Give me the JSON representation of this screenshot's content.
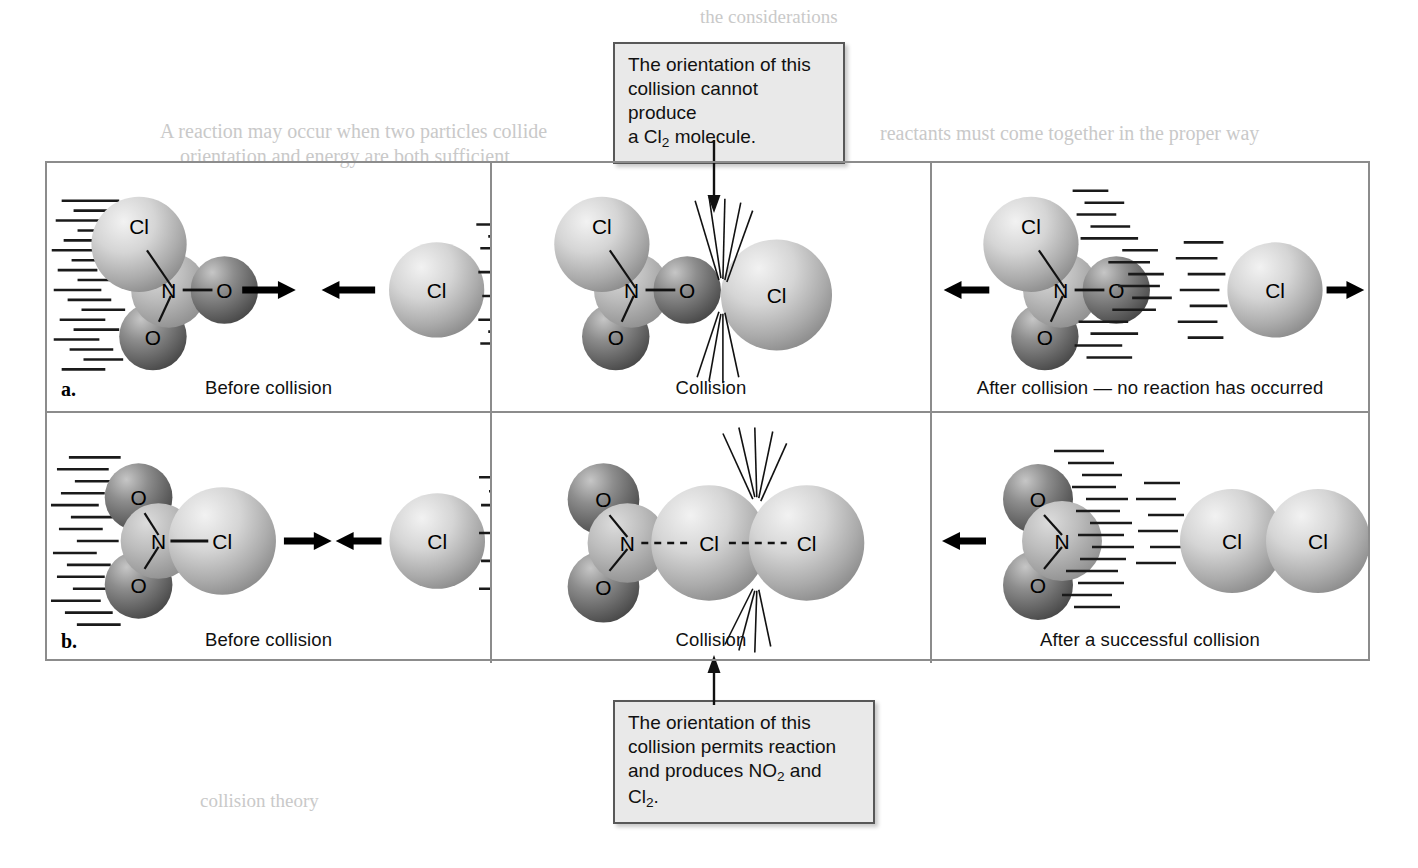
{
  "figure": {
    "title_hidden": "Collision orientation and reaction of NO2Cl with Cl",
    "frame_border_color": "#8c8c8c"
  },
  "callouts": {
    "top": {
      "name": "callout-no-reaction",
      "lines": [
        "The orientation of this",
        "collision cannot produce",
        "a Cl",
        "2",
        " molecule."
      ],
      "line1": "The orientation of this",
      "line2": "collision cannot produce",
      "line3_pre": "a Cl",
      "line3_sub": "2",
      "line3_post": " molecule.",
      "target_panel": "row-a-collision"
    },
    "bottom": {
      "name": "callout-successful-reaction",
      "line1": "The orientation of this",
      "line2": "collision permits reaction",
      "line3_pre": "and produces NO",
      "line3_sub": "2",
      "line3_post": " and",
      "line4_pre": "Cl",
      "line4_sub": "2",
      "line4_post": ".",
      "target_panel": "row-b-collision"
    }
  },
  "rows": [
    {
      "letter": "a.",
      "description": "Unsuccessful collision orientation",
      "panels": [
        {
          "id": "row-a-before",
          "caption": "Before collision"
        },
        {
          "id": "row-a-collision",
          "caption": "Collision"
        },
        {
          "id": "row-a-after",
          "caption": "After collision — no reaction has occurred"
        }
      ]
    },
    {
      "letter": "b.",
      "description": "Successful collision orientation",
      "panels": [
        {
          "id": "row-b-before",
          "caption": "Before collision"
        },
        {
          "id": "row-b-collision",
          "caption": "Collision"
        },
        {
          "id": "row-b-after",
          "caption": "After a successful collision"
        }
      ]
    }
  ],
  "atom_labels": {
    "cl": "Cl",
    "n": "N",
    "o": "O"
  },
  "bond_labels": {
    "n_o_bond": "—",
    "n_cl_bond": "—",
    "dashed_n_cl": "-----",
    "dashed_cl_cl": "-------"
  },
  "colors": {
    "chlorine_light": "#d8d8d8",
    "chlorine_mid": "#a8a8a8",
    "nitrogen": "#b4b4b4",
    "oxygen_dark": "#6a6a6a",
    "frame": "#8c8c8c",
    "callout_fill": "#e9e9e9",
    "callout_border": "#585858",
    "text": "#111111"
  },
  "bleed_text": {
    "t1": "the considerations",
    "t2": "A reaction may occur when two particles collide",
    "t3": "orientation and energy are both sufficient",
    "t4": "reactants must come together in the proper way",
    "t5": "collision theory"
  }
}
